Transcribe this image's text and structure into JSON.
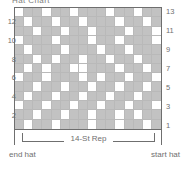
{
  "title": "Hat Chart",
  "chart_data": {
    "type": "heatmap",
    "title": "Hat Chart",
    "xlabel": "",
    "ylabel": "",
    "rows": 13,
    "columns": 16,
    "legend": {
      "filled": "#c2c2c2",
      "empty": "#ffffff"
    },
    "row_labels_left": [
      12,
      10,
      8,
      6,
      4,
      2
    ],
    "row_labels_right": [
      13,
      11,
      9,
      7,
      5,
      3,
      1
    ],
    "annotations": [
      "14-St Rep",
      "end hat",
      "start hat"
    ],
    "grid": [
      [
        0,
        1,
        1,
        0,
        1,
        1,
        0,
        1,
        1,
        1,
        0,
        1,
        1,
        0,
        1,
        1
      ],
      [
        1,
        0,
        1,
        1,
        0,
        1,
        1,
        0,
        1,
        1,
        1,
        0,
        1,
        1,
        0,
        1
      ],
      [
        1,
        1,
        0,
        1,
        1,
        0,
        1,
        1,
        0,
        1,
        1,
        1,
        0,
        1,
        1,
        0
      ],
      [
        0,
        1,
        1,
        1,
        0,
        1,
        1,
        1,
        0,
        1,
        1,
        0,
        1,
        1,
        1,
        0
      ],
      [
        1,
        0,
        1,
        1,
        1,
        0,
        1,
        1,
        1,
        0,
        1,
        1,
        0,
        1,
        1,
        1
      ],
      [
        1,
        1,
        0,
        1,
        0,
        1,
        1,
        0,
        1,
        1,
        0,
        1,
        1,
        0,
        1,
        1
      ],
      [
        1,
        0,
        1,
        0,
        1,
        1,
        0,
        0,
        1,
        1,
        1,
        0,
        1,
        1,
        0,
        1
      ],
      [
        0,
        1,
        1,
        0,
        1,
        1,
        1,
        0,
        1,
        0,
        1,
        1,
        0,
        1,
        1,
        0
      ],
      [
        1,
        1,
        0,
        1,
        1,
        0,
        1,
        1,
        0,
        1,
        1,
        0,
        1,
        1,
        0,
        1
      ],
      [
        1,
        0,
        1,
        1,
        0,
        1,
        1,
        0,
        1,
        1,
        0,
        1,
        1,
        0,
        1,
        1
      ],
      [
        0,
        1,
        1,
        0,
        1,
        1,
        0,
        1,
        1,
        0,
        1,
        1,
        0,
        1,
        1,
        0
      ],
      [
        1,
        1,
        0,
        1,
        1,
        0,
        1,
        1,
        0,
        1,
        1,
        0,
        1,
        0,
        1,
        1
      ],
      [
        1,
        0,
        1,
        1,
        0,
        1,
        1,
        1,
        0,
        1,
        1,
        0,
        1,
        1,
        0,
        1
      ]
    ]
  },
  "labels": {
    "repeat": "14-St Rep",
    "end_hat": "end hat",
    "start_hat": "start hat"
  }
}
